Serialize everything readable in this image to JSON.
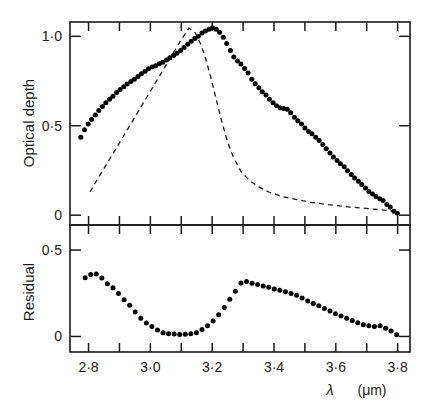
{
  "figure": {
    "title": "",
    "xaxis_label": "λ",
    "xaxis_unit": "(μm)",
    "panels": [
      {
        "name": "optical-depth",
        "ylabel": "Optical depth",
        "ytick_labels": [
          "0",
          "0·5",
          "1·0"
        ],
        "ytick_values": [
          0,
          0.5,
          1.0
        ],
        "xtick_labels": [],
        "inverted_y": true
      },
      {
        "name": "residual",
        "ylabel": "Residual",
        "ytick_labels": [
          "0·5",
          "0"
        ],
        "ytick_values": [
          0.5,
          0.0
        ],
        "xtick_labels": [
          "2·8",
          "3·0",
          "3·2",
          "3·4",
          "3·6",
          "3·8"
        ],
        "xtick_values": [
          2.8,
          3.0,
          3.2,
          3.4,
          3.6,
          3.8
        ],
        "inverted_y": false
      }
    ]
  },
  "chart_data": [
    {
      "type": "scatter",
      "title": "",
      "panel": "optical-depth",
      "xlabel": "λ (μm)",
      "ylabel": "Optical depth",
      "xlim": [
        2.74,
        3.84
      ],
      "ylim": [
        1.08,
        -0.055
      ],
      "yaxis_inverted": true,
      "grid": false,
      "legend": "none",
      "xticks_major": [
        2.8,
        3.0,
        3.2,
        3.4,
        3.6,
        3.8
      ],
      "xticks_minor_step": 0.1,
      "yticks": [
        0,
        0.5,
        1.0
      ],
      "series": [
        {
          "name": "observed optical depth",
          "style": "filled-circles",
          "marker_color": "#000000",
          "x": [
            2.775,
            2.787,
            2.799,
            2.81,
            2.822,
            2.833,
            2.845,
            2.856,
            2.868,
            2.879,
            2.891,
            2.902,
            2.914,
            2.925,
            2.937,
            2.948,
            2.96,
            2.971,
            2.983,
            2.994,
            3.006,
            3.017,
            3.029,
            3.04,
            3.052,
            3.063,
            3.075,
            3.086,
            3.098,
            3.109,
            3.121,
            3.132,
            3.144,
            3.155,
            3.167,
            3.178,
            3.19,
            3.201,
            3.213,
            3.224,
            3.236,
            3.247,
            3.259,
            3.27,
            3.282,
            3.293,
            3.305,
            3.316,
            3.328,
            3.339,
            3.351,
            3.362,
            3.374,
            3.385,
            3.397,
            3.408,
            3.42,
            3.431,
            3.443,
            3.454,
            3.466,
            3.477,
            3.489,
            3.5,
            3.512,
            3.523,
            3.535,
            3.546,
            3.558,
            3.569,
            3.581,
            3.592,
            3.604,
            3.615,
            3.627,
            3.638,
            3.65,
            3.661,
            3.673,
            3.684,
            3.696,
            3.707,
            3.719,
            3.73,
            3.742,
            3.753,
            3.765,
            3.776,
            3.788,
            3.799
          ],
          "y": [
            0.435,
            0.478,
            0.51,
            0.535,
            0.56,
            0.585,
            0.607,
            0.628,
            0.648,
            0.665,
            0.686,
            0.702,
            0.718,
            0.733,
            0.748,
            0.76,
            0.775,
            0.79,
            0.805,
            0.818,
            0.828,
            0.836,
            0.847,
            0.855,
            0.868,
            0.88,
            0.893,
            0.905,
            0.92,
            0.937,
            0.955,
            0.972,
            0.988,
            1.0,
            1.018,
            1.03,
            1.04,
            1.048,
            1.04,
            1.022,
            0.995,
            0.96,
            0.92,
            0.885,
            0.862,
            0.845,
            0.82,
            0.795,
            0.76,
            0.735,
            0.712,
            0.69,
            0.672,
            0.648,
            0.628,
            0.612,
            0.6,
            0.596,
            0.592,
            0.572,
            0.548,
            0.528,
            0.51,
            0.488,
            0.468,
            0.455,
            0.435,
            0.418,
            0.395,
            0.372,
            0.348,
            0.325,
            0.305,
            0.288,
            0.27,
            0.248,
            0.228,
            0.208,
            0.19,
            0.172,
            0.152,
            0.132,
            0.118,
            0.105,
            0.092,
            0.082,
            0.06,
            0.045,
            0.022,
            0.01
          ]
        },
        {
          "name": "model fit (dashed)",
          "style": "dashed-line",
          "line_color": "#1a1a1a",
          "x": [
            2.805,
            2.83,
            2.86,
            2.89,
            2.92,
            2.95,
            2.98,
            3.01,
            3.04,
            3.07,
            3.1,
            3.125,
            3.145,
            3.162,
            3.178,
            3.195,
            3.212,
            3.23,
            3.25,
            3.27,
            3.295,
            3.32,
            3.35,
            3.385,
            3.425,
            3.47,
            3.52,
            3.57,
            3.62,
            3.67,
            3.72,
            3.77,
            3.8
          ],
          "y": [
            0.13,
            0.205,
            0.29,
            0.375,
            0.462,
            0.548,
            0.635,
            0.722,
            0.808,
            0.895,
            0.982,
            1.045,
            1.02,
            0.96,
            0.88,
            0.775,
            0.655,
            0.53,
            0.408,
            0.318,
            0.24,
            0.195,
            0.158,
            0.128,
            0.105,
            0.088,
            0.072,
            0.06,
            0.05,
            0.042,
            0.034,
            0.026,
            0.02
          ]
        }
      ]
    },
    {
      "type": "scatter",
      "title": "",
      "panel": "residual",
      "xlabel": "λ (μm)",
      "ylabel": "Residual",
      "xlim": [
        2.74,
        3.84
      ],
      "ylim": [
        -0.09,
        0.645
      ],
      "yaxis_inverted": false,
      "grid": false,
      "legend": "none",
      "xticks_major": [
        2.8,
        3.0,
        3.2,
        3.4,
        3.6,
        3.8
      ],
      "xticks_minor_step": 0.1,
      "yticks": [
        0.0,
        0.5
      ],
      "series": [
        {
          "name": "residual",
          "style": "filled-circles",
          "marker_color": "#000000",
          "x": [
            2.789,
            2.807,
            2.825,
            2.843,
            2.861,
            2.879,
            2.897,
            2.915,
            2.933,
            2.951,
            2.969,
            2.987,
            3.005,
            3.023,
            3.041,
            3.059,
            3.077,
            3.095,
            3.113,
            3.131,
            3.149,
            3.167,
            3.185,
            3.203,
            3.221,
            3.239,
            3.257,
            3.275,
            3.293,
            3.311,
            3.329,
            3.347,
            3.365,
            3.383,
            3.401,
            3.419,
            3.437,
            3.455,
            3.473,
            3.491,
            3.509,
            3.527,
            3.545,
            3.563,
            3.581,
            3.599,
            3.617,
            3.635,
            3.653,
            3.671,
            3.689,
            3.707,
            3.725,
            3.743,
            3.761,
            3.779,
            3.797
          ],
          "y": [
            0.34,
            0.358,
            0.362,
            0.338,
            0.305,
            0.282,
            0.248,
            0.212,
            0.18,
            0.142,
            0.105,
            0.078,
            0.058,
            0.038,
            0.022,
            0.015,
            0.014,
            0.012,
            0.013,
            0.015,
            0.022,
            0.04,
            0.062,
            0.09,
            0.125,
            0.168,
            0.215,
            0.262,
            0.31,
            0.318,
            0.308,
            0.3,
            0.292,
            0.285,
            0.275,
            0.268,
            0.258,
            0.248,
            0.238,
            0.222,
            0.205,
            0.19,
            0.178,
            0.162,
            0.148,
            0.132,
            0.118,
            0.105,
            0.092,
            0.08,
            0.068,
            0.062,
            0.058,
            0.062,
            0.048,
            0.032,
            0.01
          ]
        }
      ]
    }
  ]
}
